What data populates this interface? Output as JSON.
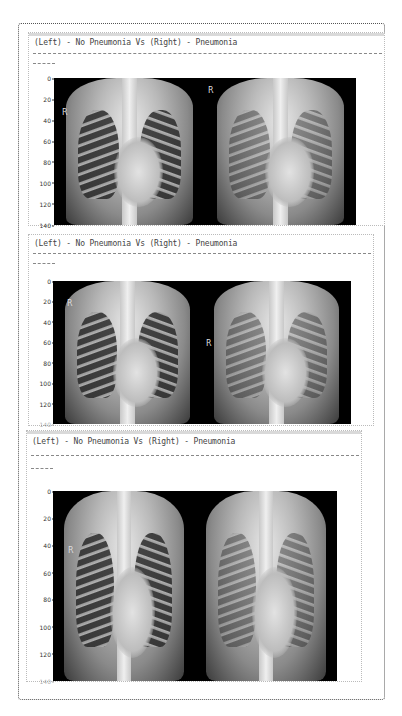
{
  "output_cell": {
    "panels": [
      {
        "title": "(Left) - No Pneumonia Vs (Right) - Pneumonia",
        "separator_long": "--------------------------------------------------------------------------------",
        "separator_short": "------",
        "y_ticks": [
          "0",
          "20",
          "40",
          "60",
          "80",
          "100",
          "120",
          "140"
        ],
        "left_image": {
          "label": "No Pneumonia",
          "marker": "R"
        },
        "right_image": {
          "label": "Pneumonia",
          "marker": "R"
        }
      },
      {
        "title": "(Left) - No Pneumonia Vs (Right) - Pneumonia",
        "separator_long": "--------------------------------------------------------------------------------",
        "separator_short": "------",
        "y_ticks": [
          "0",
          "20",
          "40",
          "60",
          "80",
          "100",
          "120",
          "140"
        ],
        "left_image": {
          "label": "No Pneumonia",
          "marker": "R"
        },
        "right_image": {
          "label": "Pneumonia",
          "marker": "R"
        }
      },
      {
        "title": "(Left) - No Pneumonia Vs (Right) - Pneumonia",
        "separator_long": "--------------------------------------------------------------------------------",
        "separator_short": "------",
        "y_ticks": [
          "0",
          "20",
          "40",
          "60",
          "80",
          "100",
          "120",
          "140"
        ],
        "left_image": {
          "label": "No Pneumonia",
          "marker": "R"
        },
        "right_image": {
          "label": "Pneumonia",
          "marker": ""
        }
      }
    ]
  }
}
